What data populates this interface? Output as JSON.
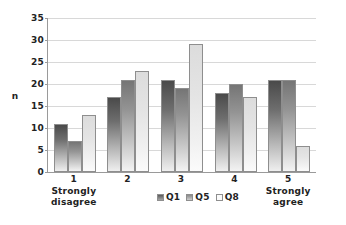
{
  "chart_data": {
    "type": "bar",
    "title": "",
    "subtitle": "",
    "xlabel": "",
    "ylabel": "n",
    "ylim": [
      0,
      35
    ],
    "ytick_step": 5,
    "yticks": [
      35,
      30,
      25,
      20,
      15,
      10,
      5,
      0
    ],
    "grid": true,
    "legend_position": "bottom-center",
    "categories": [
      "1",
      "2",
      "3",
      "4",
      "5"
    ],
    "category_sublabels": [
      "Strongly\ndisagree",
      "",
      "",
      "",
      "Strongly\nagree"
    ],
    "series": [
      {
        "name": "Q1",
        "values": [
          11,
          17,
          21,
          18,
          21
        ],
        "color": "#5a5a5a"
      },
      {
        "name": "Q5",
        "values": [
          7,
          21,
          19,
          20,
          21
        ],
        "color": "#9a9a9a"
      },
      {
        "name": "Q8",
        "values": [
          13,
          23,
          29,
          17,
          6
        ],
        "color": "#eeeeee"
      }
    ]
  },
  "axis": {
    "y_title": "n"
  },
  "legend": {
    "items": [
      {
        "label": "Q1"
      },
      {
        "label": "Q5"
      },
      {
        "label": "Q8"
      }
    ]
  }
}
